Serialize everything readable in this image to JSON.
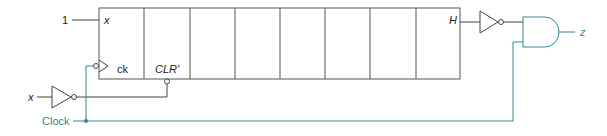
{
  "diagram": {
    "type": "logic-circuit",
    "colors": {
      "black_wire": "#444444",
      "clock_wire": "#2a8a8e",
      "background": "#ffffff"
    },
    "labels": {
      "constant_input": "1",
      "shift_in": "x",
      "clock_input_label": "ck",
      "clear_label": "CLR'",
      "last_output": "H",
      "x_input": "x",
      "clock": "Clock",
      "output": "z"
    },
    "register": {
      "cells": 8
    },
    "components": [
      {
        "id": "shift-register",
        "kind": "register",
        "bits": 8
      },
      {
        "id": "x-inverter",
        "kind": "NOT",
        "input": "x",
        "output": "CLR'"
      },
      {
        "id": "h-inverter",
        "kind": "NOT",
        "input": "H"
      },
      {
        "id": "and-gate",
        "kind": "AND",
        "inputs": [
          "H'",
          "Clock"
        ],
        "output": "z"
      }
    ]
  }
}
